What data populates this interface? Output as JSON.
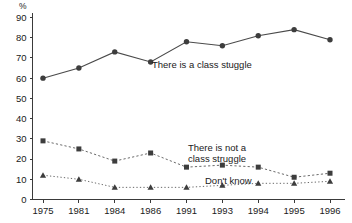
{
  "chart_data": {
    "type": "line",
    "title": "",
    "subtitle": "",
    "xlabel": "",
    "ylabel": "%",
    "ylim": [
      0,
      90
    ],
    "yticks": [
      0,
      10,
      20,
      30,
      40,
      50,
      60,
      70,
      80,
      90
    ],
    "grid": false,
    "legend_position": "inline-annotations",
    "categories": [
      "1975",
      "1981",
      "1984",
      "1986",
      "1991",
      "1993",
      "1994",
      "1995",
      "1996"
    ],
    "series": [
      {
        "name": "There is a class stuggle",
        "marker": "circle",
        "linestyle": "solid",
        "color": "#3d3d3d",
        "values": [
          60,
          65,
          73,
          68,
          78,
          76,
          81,
          84,
          79
        ]
      },
      {
        "name": "There is not a class struggle",
        "marker": "square",
        "linestyle": "dashed",
        "color": "#3d3d3d",
        "values": [
          29,
          25,
          19,
          23,
          16,
          17,
          16,
          11,
          13
        ]
      },
      {
        "name": "Don't know",
        "marker": "triangle",
        "linestyle": "dotted",
        "color": "#3d3d3d",
        "values": [
          12,
          10,
          6,
          6,
          6,
          7,
          8,
          8,
          9
        ]
      }
    ],
    "annotations": [
      {
        "text": "There is a class stuggle",
        "x_px": 152,
        "y_px": 68
      },
      {
        "text": "There is not a",
        "x_px": 188,
        "y_px": 151
      },
      {
        "text": "class struggle",
        "x_px": 188,
        "y_px": 162
      },
      {
        "text": "Don't know",
        "x_px": 205,
        "y_px": 184
      }
    ]
  },
  "axis": {
    "unit_label": "%",
    "y_tick_labels": [
      "90",
      "80",
      "70",
      "60",
      "50",
      "40",
      "30",
      "20",
      "10",
      "0"
    ],
    "x_tick_labels": [
      "1975",
      "1981",
      "1984",
      "1986",
      "1991",
      "1993",
      "1994",
      "1995",
      "1996"
    ]
  },
  "colors": {
    "axis": "#3a3a3a",
    "marker": "#3d3d3d",
    "solid_line": "#4a4a4a",
    "dashed_line": "#6a6a6a",
    "background": "#ffffff"
  }
}
